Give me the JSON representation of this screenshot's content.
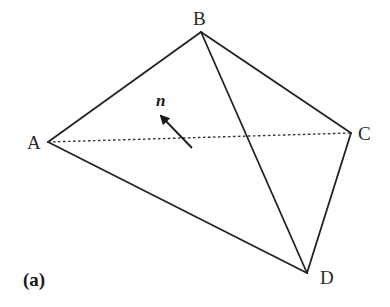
{
  "figure": {
    "caption": "(a)",
    "normal_label": "n",
    "stroke_color": "#222222",
    "vertices": {
      "A": {
        "label": "A",
        "x": 48,
        "y": 142
      },
      "B": {
        "label": "B",
        "x": 201,
        "y": 32
      },
      "C": {
        "label": "C",
        "x": 351,
        "y": 133
      },
      "D": {
        "label": "D",
        "x": 307,
        "y": 273
      }
    },
    "edges": [
      {
        "from": "A",
        "to": "B",
        "style": "solid"
      },
      {
        "from": "B",
        "to": "C",
        "style": "solid"
      },
      {
        "from": "B",
        "to": "D",
        "style": "solid"
      },
      {
        "from": "C",
        "to": "D",
        "style": "solid"
      },
      {
        "from": "A",
        "to": "D",
        "style": "solid"
      },
      {
        "from": "A",
        "to": "C",
        "style": "dotted"
      }
    ],
    "normal_vector": {
      "from": {
        "x": 192,
        "y": 148
      },
      "to": {
        "x": 159,
        "y": 114
      }
    }
  }
}
